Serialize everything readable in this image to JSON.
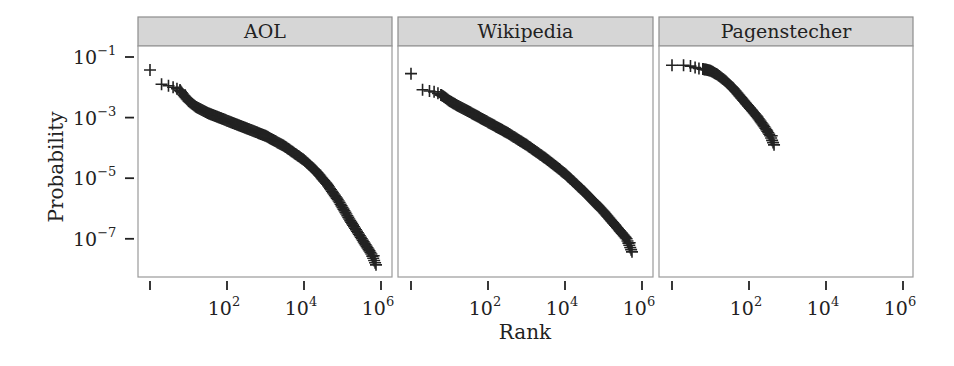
{
  "chart_data": {
    "type": "scatter",
    "title": "",
    "xlabel": "Rank",
    "ylabel": "Probability",
    "xscale": "log10",
    "yscale": "log10",
    "xlim": [
      1,
      1000000
    ],
    "ylim": [
      1e-08,
      0.1
    ],
    "grid": false,
    "legend": null,
    "marker": "+",
    "x_ticks": [
      {
        "value": 1,
        "base": "",
        "exp": ""
      },
      {
        "value": 100,
        "base": "10",
        "exp": "2"
      },
      {
        "value": 10000,
        "base": "10",
        "exp": "4"
      },
      {
        "value": 1000000,
        "base": "10",
        "exp": "6"
      }
    ],
    "y_ticks": [
      {
        "value": 0.1,
        "base": "10",
        "exp": "−1"
      },
      {
        "value": 0.001,
        "base": "10",
        "exp": "−3"
      },
      {
        "value": 1e-05,
        "base": "10",
        "exp": "−5"
      },
      {
        "value": 1e-07,
        "base": "10",
        "exp": "−7"
      }
    ],
    "facets": [
      {
        "name": "AOL",
        "description": "Rank-probability curve; concave, steepening after rank ~1e4",
        "points_log10": [
          [
            0.0,
            -1.43
          ],
          [
            0.3,
            -1.9
          ],
          [
            0.48,
            -1.95
          ],
          [
            0.6,
            -2.0
          ],
          [
            0.7,
            -2.05
          ],
          [
            0.78,
            -2.1
          ],
          [
            0.9,
            -2.3
          ],
          [
            1.0,
            -2.45
          ],
          [
            1.2,
            -2.65
          ],
          [
            1.5,
            -2.85
          ],
          [
            2.0,
            -3.1
          ],
          [
            2.5,
            -3.35
          ],
          [
            3.0,
            -3.6
          ],
          [
            3.5,
            -3.95
          ],
          [
            4.0,
            -4.4
          ],
          [
            4.3,
            -4.75
          ],
          [
            4.6,
            -5.2
          ],
          [
            4.9,
            -5.75
          ],
          [
            5.2,
            -6.4
          ],
          [
            5.5,
            -7.0
          ],
          [
            5.75,
            -7.5
          ],
          [
            5.87,
            -7.86
          ]
        ]
      },
      {
        "name": "Wikipedia",
        "description": "Rank-probability curve; smooth power-law-like decline",
        "points_log10": [
          [
            0.0,
            -1.55
          ],
          [
            0.3,
            -2.08
          ],
          [
            0.48,
            -2.12
          ],
          [
            0.6,
            -2.15
          ],
          [
            0.7,
            -2.2
          ],
          [
            0.78,
            -2.25
          ],
          [
            0.9,
            -2.35
          ],
          [
            1.0,
            -2.45
          ],
          [
            1.2,
            -2.6
          ],
          [
            1.5,
            -2.8
          ],
          [
            2.0,
            -3.15
          ],
          [
            2.5,
            -3.5
          ],
          [
            3.0,
            -3.9
          ],
          [
            3.5,
            -4.35
          ],
          [
            4.0,
            -4.85
          ],
          [
            4.5,
            -5.45
          ],
          [
            5.0,
            -6.1
          ],
          [
            5.4,
            -6.7
          ],
          [
            5.6,
            -7.0
          ],
          [
            5.74,
            -7.43
          ]
        ]
      },
      {
        "name": "Pagenstecher",
        "description": "Rank-probability curve; short range up to ~450 ranks",
        "points_log10": [
          [
            0.0,
            -1.27
          ],
          [
            0.3,
            -1.27
          ],
          [
            0.48,
            -1.3
          ],
          [
            0.6,
            -1.35
          ],
          [
            0.7,
            -1.38
          ],
          [
            0.8,
            -1.4
          ],
          [
            0.9,
            -1.42
          ],
          [
            1.0,
            -1.45
          ],
          [
            1.2,
            -1.6
          ],
          [
            1.4,
            -1.8
          ],
          [
            1.6,
            -2.05
          ],
          [
            1.8,
            -2.35
          ],
          [
            2.0,
            -2.65
          ],
          [
            2.2,
            -2.95
          ],
          [
            2.4,
            -3.3
          ],
          [
            2.55,
            -3.6
          ],
          [
            2.65,
            -3.9
          ]
        ]
      }
    ]
  },
  "layout": {
    "panels": [
      {
        "left": 138,
        "right": 392,
        "tick0": 150
      },
      {
        "left": 398,
        "right": 653,
        "tick0": 411
      },
      {
        "left": 659,
        "right": 913,
        "tick0": 672
      }
    ],
    "strip_top": 17,
    "strip_bottom": 46,
    "panel_bottom": 277,
    "px_per_decade_x": 38.5,
    "y_top_tick": 57,
    "px_per_decade_y": 30.3
  },
  "colors": {
    "strip_fill": "#d6d6d6",
    "strip_border": "#8c8c8c",
    "panel_border": "#9a9a9a",
    "marker": "#222222",
    "text": "#222222"
  }
}
